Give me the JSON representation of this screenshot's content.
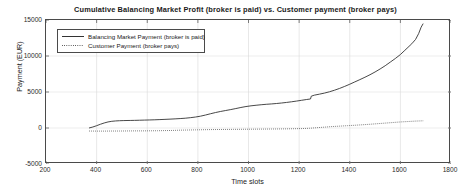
{
  "chart_data": {
    "type": "line",
    "title": "Cumulative Balancing Market Profit (broker is paid) vs. Customer payment (broker pays)",
    "xlabel": "Time slots",
    "ylabel": "Payment (EUR)",
    "xlim": [
      200,
      1800
    ],
    "ylim": [
      -5000,
      15000
    ],
    "xticks": [
      200,
      400,
      600,
      800,
      1000,
      1200,
      1400,
      1600,
      1800
    ],
    "yticks": [
      -5000,
      0,
      5000,
      10000,
      15000
    ],
    "grid": true,
    "legend_position": "upper-left",
    "series": [
      {
        "name": "Balancing Market Payment (broker is paid)",
        "style": "solid",
        "color": "#333333",
        "x": [
          370,
          385,
          400,
          415,
          430,
          445,
          460,
          475,
          490,
          505,
          520,
          535,
          550,
          570,
          590,
          610,
          630,
          650,
          670,
          690,
          710,
          730,
          750,
          770,
          790,
          810,
          830,
          850,
          870,
          890,
          910,
          930,
          950,
          970,
          990,
          1010,
          1030,
          1050,
          1070,
          1090,
          1110,
          1130,
          1150,
          1170,
          1190,
          1210,
          1230,
          1245,
          1248,
          1260,
          1280,
          1300,
          1320,
          1340,
          1360,
          1380,
          1400,
          1420,
          1440,
          1460,
          1480,
          1500,
          1520,
          1540,
          1560,
          1580,
          1600,
          1615,
          1630,
          1645,
          1660,
          1672,
          1682,
          1690
        ],
        "y": [
          0,
          140,
          320,
          520,
          700,
          840,
          930,
          980,
          1010,
          1030,
          1040,
          1050,
          1060,
          1080,
          1100,
          1120,
          1140,
          1170,
          1200,
          1230,
          1270,
          1310,
          1360,
          1430,
          1520,
          1640,
          1800,
          1980,
          2150,
          2300,
          2430,
          2560,
          2700,
          2850,
          2980,
          3080,
          3160,
          3230,
          3290,
          3340,
          3400,
          3470,
          3550,
          3640,
          3740,
          3850,
          3960,
          4030,
          4420,
          4560,
          4700,
          4850,
          5030,
          5250,
          5500,
          5780,
          6080,
          6400,
          6720,
          7050,
          7400,
          7780,
          8200,
          8650,
          9150,
          9650,
          10200,
          10700,
          11200,
          11700,
          12300,
          13100,
          14000,
          14500
        ]
      },
      {
        "name": "Customer Payment (broker pays)",
        "style": "dotted",
        "color": "#3a3a3a",
        "x": [
          370,
          400,
          430,
          460,
          490,
          520,
          550,
          580,
          610,
          640,
          670,
          700,
          730,
          760,
          790,
          820,
          850,
          880,
          910,
          940,
          970,
          1000,
          1030,
          1060,
          1090,
          1120,
          1150,
          1180,
          1210,
          1240,
          1270,
          1300,
          1330,
          1360,
          1390,
          1420,
          1450,
          1480,
          1510,
          1540,
          1570,
          1600,
          1630,
          1660,
          1690
        ],
        "y": [
          -420,
          -430,
          -430,
          -420,
          -420,
          -410,
          -400,
          -400,
          -390,
          -380,
          -360,
          -340,
          -300,
          -280,
          -260,
          -240,
          -220,
          -210,
          -200,
          -190,
          -180,
          -170,
          -160,
          -150,
          -140,
          -130,
          -120,
          -100,
          -80,
          -40,
          40,
          120,
          200,
          260,
          320,
          380,
          450,
          520,
          600,
          680,
          760,
          840,
          900,
          960,
          1000
        ]
      }
    ]
  },
  "legend": {
    "items": [
      {
        "label": "Balancing Market Payment (broker is paid)",
        "style": "solid"
      },
      {
        "label": "Customer Payment (broker pays)",
        "style": "dotted"
      }
    ]
  }
}
